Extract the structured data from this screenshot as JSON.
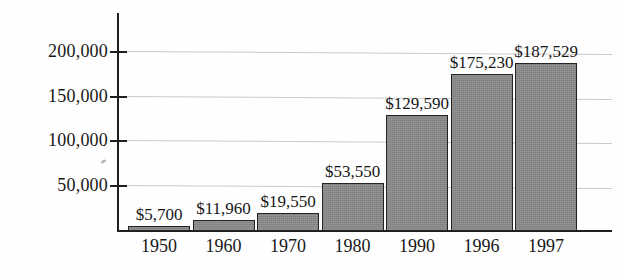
{
  "chart_data": {
    "type": "bar",
    "title": "",
    "subtitle": "",
    "xlabel": "",
    "ylabel": "",
    "categories": [
      "1950",
      "1960",
      "1970",
      "1980",
      "1990",
      "1996",
      "1997"
    ],
    "values": [
      5700,
      11960,
      19550,
      53550,
      129590,
      175230,
      187529
    ],
    "data_labels": [
      "$5,700",
      "$11,960",
      "$19,550",
      "$53,550",
      "$129,590",
      "$175,230",
      "$187,529"
    ],
    "ytick_labels": [
      "200,000",
      "150,000",
      "100,000",
      "50,000"
    ],
    "yticks": [
      200000,
      150000,
      100000,
      50000
    ],
    "ylim": [
      0,
      243000
    ],
    "grid": true,
    "grid_axis": "y",
    "legend": null,
    "legend_position": "none",
    "series": [
      {
        "name": "value",
        "values": [
          5700,
          11960,
          19550,
          53550,
          129590,
          175230,
          187529
        ]
      }
    ],
    "colors": {
      "bar_fill": "#8b8b8b",
      "bar_border": "#232323",
      "axis": "#1f1f1f",
      "gridline": "#c9c9c9",
      "background": "#fefefe",
      "text": "#181818"
    }
  }
}
